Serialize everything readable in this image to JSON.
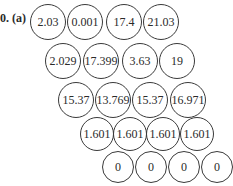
{
  "problem": {
    "label": "0. (a)"
  },
  "rows": [
    {
      "y": 22,
      "r": 18,
      "nodes": [
        {
          "x": 48,
          "value": "2.03"
        },
        {
          "x": 85,
          "value": "0.001"
        },
        {
          "x": 124,
          "value": "17.4"
        },
        {
          "x": 161,
          "value": "21.03"
        }
      ]
    },
    {
      "y": 61,
      "r": 18,
      "nodes": [
        {
          "x": 63,
          "value": "2.029"
        },
        {
          "x": 101,
          "value": "17.399"
        },
        {
          "x": 140,
          "value": "3.63"
        },
        {
          "x": 177,
          "value": "19"
        }
      ]
    },
    {
      "y": 100,
      "r": 18,
      "nodes": [
        {
          "x": 76,
          "value": "15.37"
        },
        {
          "x": 113,
          "value": "13.769"
        },
        {
          "x": 150,
          "value": "15.37"
        },
        {
          "x": 188,
          "value": "16.971"
        }
      ]
    },
    {
      "y": 134,
      "r": 17,
      "nodes": [
        {
          "x": 97,
          "value": "1.601"
        },
        {
          "x": 130,
          "value": "1.601"
        },
        {
          "x": 163,
          "value": "1.601"
        },
        {
          "x": 197,
          "value": "1.601"
        }
      ]
    },
    {
      "y": 167,
      "r": 16,
      "nodes": [
        {
          "x": 118,
          "value": "0"
        },
        {
          "x": 151,
          "value": "0"
        },
        {
          "x": 184,
          "value": "0"
        },
        {
          "x": 217,
          "value": "0"
        }
      ]
    }
  ]
}
